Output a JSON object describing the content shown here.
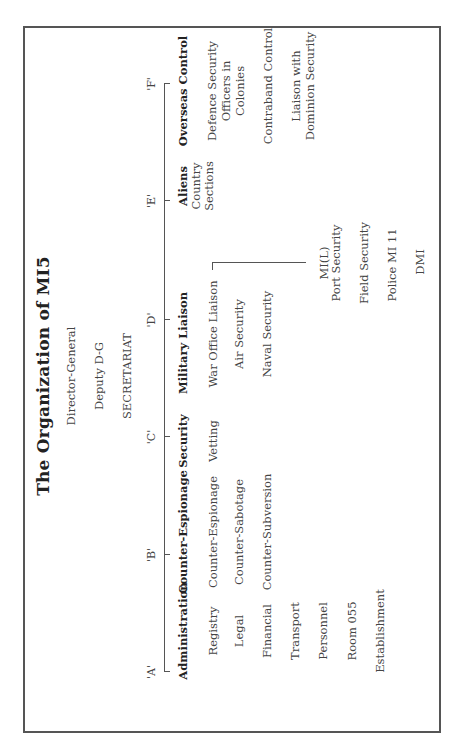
{
  "title": "The Organization of MI5",
  "leadership": [
    "Director-General",
    "Deputy D-G",
    "SECRETARIAT"
  ],
  "divisions": [
    {
      "code": "'A'",
      "name": "Administration",
      "sections": [
        "Registry",
        "Legal",
        "Financial",
        "Transport",
        "Personnel",
        "Room 055",
        "Establishment"
      ]
    },
    {
      "code": "'B'",
      "name": "Counter-Espionage",
      "sections": [
        "Counter-Espionage",
        "Counter-Sabotage",
        "Counter-Subversion"
      ]
    },
    {
      "code": "'C'",
      "name": "Security",
      "sections": [
        "Vetting"
      ]
    },
    {
      "code": "'D'",
      "name": "Military Liaison",
      "sections": [
        "War Office Liaison",
        "Air Security",
        "Naval Security"
      ],
      "sub_branch": {
        "parent": "War Office Liaison",
        "items": [
          "MI(L)",
          "Port Security",
          "Field Security",
          "Police MI 11",
          "DMI"
        ]
      }
    },
    {
      "code": "'E'",
      "name": "Aliens",
      "sections": [
        "Country",
        "Sections"
      ]
    },
    {
      "code": "'F'",
      "name": "Overseas Control",
      "sections": [
        "Defence Security",
        "Officers in",
        "Colonies",
        "Contraband Control",
        "Liaison with",
        "Dominion Security"
      ]
    }
  ]
}
